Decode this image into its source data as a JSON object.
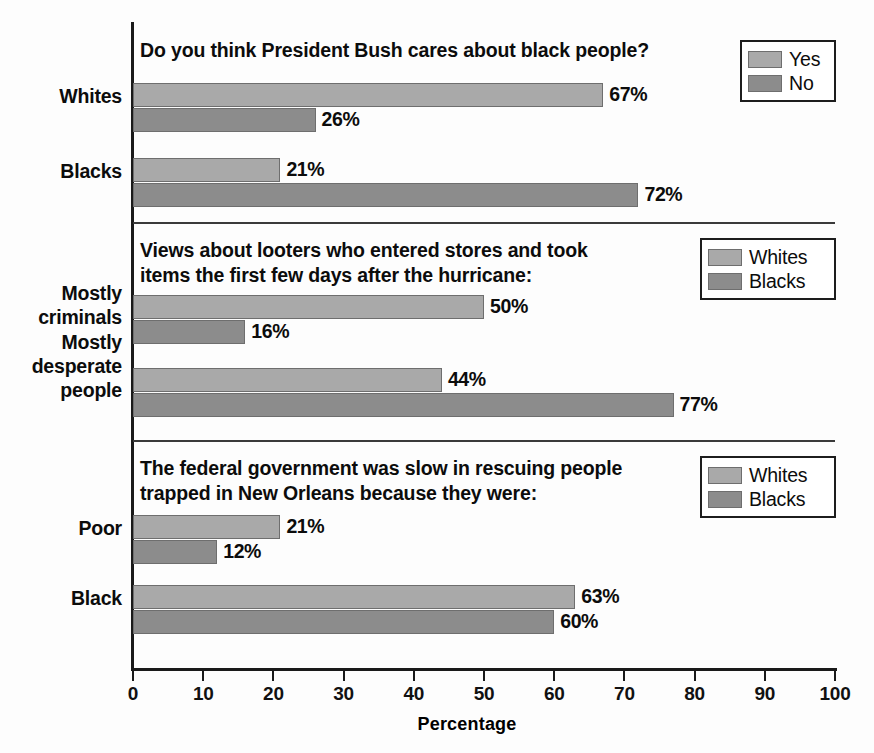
{
  "chart_data": {
    "type": "bar",
    "title": "",
    "xlabel": "Percentage",
    "ylabel": "",
    "xlim": [
      0,
      100
    ],
    "grid": false,
    "orientation": "horizontal",
    "legend_position": "top-right (per panel)",
    "axis": {
      "ticks": [
        0,
        10,
        20,
        30,
        40,
        50,
        60,
        70,
        80,
        90,
        100
      ],
      "tick_labels": [
        "0",
        "10",
        "20",
        "30",
        "40",
        "50",
        "60",
        "70",
        "80",
        "90",
        "100"
      ],
      "title": "Percentage"
    },
    "panels": [
      {
        "id": "panel-bush",
        "title": "Do you think President Bush cares about black people?",
        "legend": [
          {
            "label": "Yes",
            "swatch": "light"
          },
          {
            "label": "No",
            "swatch": "dark"
          }
        ],
        "categories": [
          "Whites",
          "Blacks"
        ],
        "series": [
          {
            "name": "Yes",
            "swatch": "light",
            "values": [
              67,
              21
            ],
            "labels": [
              "67%",
              "21%"
            ]
          },
          {
            "name": "No",
            "swatch": "dark",
            "values": [
              26,
              72
            ],
            "labels": [
              "26%",
              "72%"
            ]
          }
        ]
      },
      {
        "id": "panel-looters",
        "title": "Views about looters who entered stores and took\nitems the first few days after the hurricane:",
        "legend": [
          {
            "label": "Whites",
            "swatch": "light"
          },
          {
            "label": "Blacks",
            "swatch": "dark"
          }
        ],
        "categories": [
          "Mostly\ncriminals",
          "Mostly\ndesperate\npeople"
        ],
        "series": [
          {
            "name": "Whites",
            "swatch": "light",
            "values": [
              50,
              44
            ],
            "labels": [
              "50%",
              "44%"
            ]
          },
          {
            "name": "Blacks",
            "swatch": "dark",
            "values": [
              16,
              77
            ],
            "labels": [
              "16%",
              "77%"
            ]
          }
        ]
      },
      {
        "id": "panel-federal",
        "title": "The federal government was slow in rescuing people\ntrapped in New Orleans because they were:",
        "legend": [
          {
            "label": "Whites",
            "swatch": "light"
          },
          {
            "label": "Blacks",
            "swatch": "dark"
          }
        ],
        "categories": [
          "Poor",
          "Black"
        ],
        "series": [
          {
            "name": "Whites",
            "swatch": "light",
            "values": [
              21,
              63
            ],
            "labels": [
              "21%",
              "63%"
            ]
          },
          {
            "name": "Blacks",
            "swatch": "dark",
            "values": [
              12,
              60
            ],
            "labels": [
              "12%",
              "60%"
            ]
          }
        ]
      }
    ],
    "colors": {
      "light_bar": "#a9a9a9",
      "dark_bar": "#8c8c8c",
      "axis": "#1a1a1a",
      "text": "#0c0c0c",
      "background": "#fdfdfd"
    }
  }
}
